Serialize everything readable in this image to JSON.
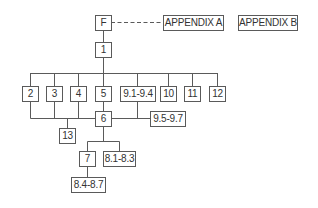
{
  "diagram": {
    "type": "flowchart",
    "line_color": "#5a5a5a",
    "nodes": {
      "F": {
        "label": "F"
      },
      "appA": {
        "label": "APPENDIX A"
      },
      "appB": {
        "label": "APPENDIX B"
      },
      "n1": {
        "label": "1"
      },
      "n2": {
        "label": "2"
      },
      "n3": {
        "label": "3"
      },
      "n4": {
        "label": "4"
      },
      "n5": {
        "label": "5"
      },
      "n9_1": {
        "label": "9.1-9.4"
      },
      "n10": {
        "label": "10"
      },
      "n11": {
        "label": "11"
      },
      "n12": {
        "label": "12"
      },
      "n6": {
        "label": "6"
      },
      "n9_5": {
        "label": "9.5-9.7"
      },
      "n13": {
        "label": "13"
      },
      "n7": {
        "label": "7"
      },
      "n8_1": {
        "label": "8.1-8.3"
      },
      "n8_4": {
        "label": "8.4-8.7"
      }
    },
    "edges": [
      {
        "from": "F",
        "to": "APPENDIX A",
        "style": "dashed"
      },
      {
        "from": "F",
        "to": "1"
      },
      {
        "from": "1",
        "to": [
          "2",
          "3",
          "4",
          "5",
          "9.1-9.4",
          "10",
          "11",
          "12"
        ]
      },
      {
        "from": [
          "2",
          "3",
          "4",
          "5",
          "9.1-9.4"
        ],
        "to": "6"
      },
      {
        "from": "6",
        "to": "9.5-9.7"
      },
      {
        "from": "6",
        "to": "13"
      },
      {
        "from": "6",
        "to": [
          "7",
          "8.1-8.3"
        ]
      },
      {
        "from": "7",
        "to": "8.4-8.7"
      }
    ]
  }
}
